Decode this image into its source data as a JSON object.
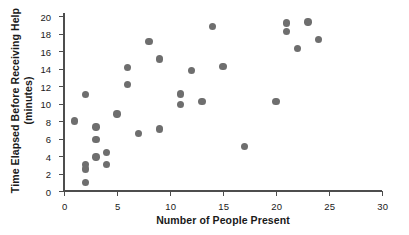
{
  "chart_data": {
    "type": "scatter",
    "title": "",
    "xlabel": "Number of People Present",
    "ylabel_line1": "Time Elapsed Before Receiving Help",
    "ylabel_line2": "(minutes)",
    "xlim": [
      0,
      30
    ],
    "ylim": [
      0,
      20
    ],
    "xticks": [
      0,
      5,
      10,
      15,
      20,
      25,
      30
    ],
    "yticks": [
      0,
      2,
      4,
      6,
      8,
      10,
      12,
      14,
      16,
      18,
      20
    ],
    "grid": false,
    "legend": false,
    "marker_color": "#6e6e6e",
    "axis_color": "#4d4d4d",
    "points": [
      {
        "x": 1,
        "y": 8.0
      },
      {
        "x": 2,
        "y": 11.0
      },
      {
        "x": 2,
        "y": 3.0
      },
      {
        "x": 2,
        "y": 2.5
      },
      {
        "x": 2,
        "y": 1.0
      },
      {
        "x": 3,
        "y": 7.3
      },
      {
        "x": 3,
        "y": 5.9
      },
      {
        "x": 3,
        "y": 3.9
      },
      {
        "x": 4,
        "y": 4.4
      },
      {
        "x": 4,
        "y": 3.0
      },
      {
        "x": 5,
        "y": 8.8
      },
      {
        "x": 6,
        "y": 14.1
      },
      {
        "x": 6,
        "y": 12.2
      },
      {
        "x": 7,
        "y": 6.6
      },
      {
        "x": 8,
        "y": 17.1
      },
      {
        "x": 9,
        "y": 15.1
      },
      {
        "x": 9,
        "y": 7.1
      },
      {
        "x": 11,
        "y": 11.1
      },
      {
        "x": 11,
        "y": 9.9
      },
      {
        "x": 12,
        "y": 13.8
      },
      {
        "x": 13,
        "y": 10.2
      },
      {
        "x": 14,
        "y": 18.8
      },
      {
        "x": 15,
        "y": 14.2
      },
      {
        "x": 17,
        "y": 5.1
      },
      {
        "x": 20,
        "y": 10.2
      },
      {
        "x": 21,
        "y": 19.2
      },
      {
        "x": 21,
        "y": 18.2
      },
      {
        "x": 22,
        "y": 16.3
      },
      {
        "x": 23,
        "y": 19.3
      },
      {
        "x": 24,
        "y": 17.3
      }
    ]
  }
}
